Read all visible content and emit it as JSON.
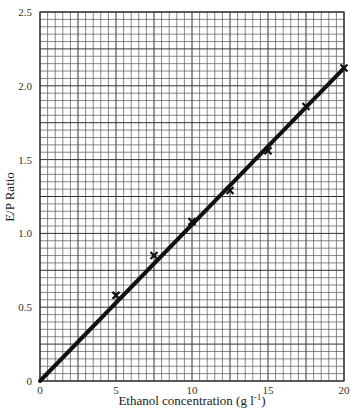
{
  "chart_data": {
    "type": "scatter",
    "title": "",
    "xlabel": "Ethanol concentration (g l-1)",
    "xlabel_main": "Ethanol concentration (g l",
    "xlabel_sup": "-1",
    "xlabel_close": ")",
    "ylabel": "E/P Ratio",
    "xlim": [
      0,
      20
    ],
    "ylim": [
      0,
      2.5
    ],
    "x_ticks": [
      0,
      5,
      10,
      15,
      20
    ],
    "x_tick_labels": [
      "0",
      "5",
      "10",
      "15",
      "20"
    ],
    "y_ticks": [
      0,
      0.5,
      1.0,
      1.5,
      2.0,
      2.5
    ],
    "y_tick_labels": [
      "0",
      "0.5",
      "1.0",
      "1.5",
      "2.0",
      "2.5"
    ],
    "grid": true,
    "grid_minor_x_step": 0.5,
    "grid_minor_y_step": 0.05,
    "legend": null,
    "series": [
      {
        "name": "Measured E/P ratio",
        "marker": "x",
        "x": [
          0,
          5,
          7.5,
          10,
          12.5,
          15,
          17.5,
          20
        ],
        "y": [
          0,
          0.58,
          0.85,
          1.08,
          1.29,
          1.56,
          1.86,
          2.12
        ]
      },
      {
        "name": "Linear fit",
        "type": "line",
        "x": [
          0,
          20
        ],
        "y": [
          0,
          2.12
        ]
      }
    ]
  },
  "colors": {
    "background": "#ffffff",
    "grid": "#555555",
    "grid_major": "#333333",
    "line": "#111111",
    "marker": "#111111",
    "text": "#1a1a1a"
  }
}
